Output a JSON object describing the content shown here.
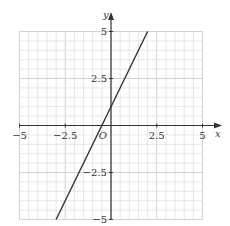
{
  "chart_data": {
    "type": "line",
    "title": "",
    "xlabel": "x",
    "ylabel": "y",
    "xlim": [
      -5,
      5
    ],
    "ylim": [
      -5,
      5
    ],
    "grid": true,
    "grid_minor_step": 0.5,
    "grid_major_step": 2.5,
    "origin_label": "O",
    "x_ticks": [
      -5,
      -2.5,
      2.5,
      5
    ],
    "x_tick_labels": [
      "−5",
      "−2.5",
      "2.5",
      "5"
    ],
    "y_ticks": [
      5,
      2.5,
      -2.5,
      -5
    ],
    "y_tick_labels": [
      "5",
      "2.5",
      "−2.5",
      "−5"
    ],
    "series": [
      {
        "name": "y = 2x + 1",
        "x": [
          -3,
          2
        ],
        "y": [
          -5,
          5
        ],
        "color": "#333333"
      }
    ]
  },
  "colors": {
    "grid_minor": "#e6e6e6",
    "grid_major": "#d2d2d2",
    "axis": "#333333",
    "line": "#333333"
  }
}
